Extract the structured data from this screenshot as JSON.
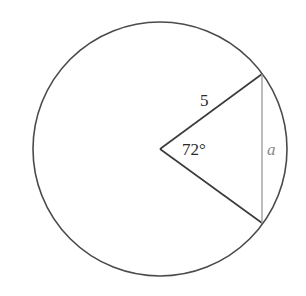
{
  "diagram": {
    "type": "circle-sector-chord",
    "circle": {
      "cx": 160,
      "cy": 149,
      "r": 127,
      "stroke": "#4a4a4a"
    },
    "center": {
      "x": 160,
      "y": 149
    },
    "points": {
      "top": {
        "x": 262,
        "y": 74
      },
      "bottom": {
        "x": 262,
        "y": 223
      }
    },
    "radius_label": "5",
    "angle_label": "72°",
    "chord_label": "a",
    "colors": {
      "outline": "#4a4a4a",
      "chord": "#9a9a9a",
      "label": "#2a2a2a",
      "chord_label": "#8a8a8a"
    }
  }
}
